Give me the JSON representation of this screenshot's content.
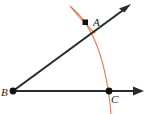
{
  "figure": {
    "background_color": "#ffffff",
    "width": 150,
    "height": 114
  },
  "colors": {
    "ray_stroke": "#2b2b2b",
    "point_fill": "#111111",
    "arc_stroke": "#e08050",
    "label_fill": "#1a1a1a"
  },
  "points": [
    {
      "id": "A",
      "label": "A",
      "marker": "square",
      "x": 85,
      "y": 22,
      "label_x": 93,
      "label_y": 26
    },
    {
      "id": "B",
      "label": "B",
      "marker": "circle",
      "x": 13,
      "y": 91,
      "label_x": 2,
      "label_y": 96
    },
    {
      "id": "C",
      "label": "C",
      "marker": "circle",
      "x": 109,
      "y": 91,
      "label_x": 112,
      "label_y": 103
    }
  ],
  "rays": [
    {
      "id": "ray-BA",
      "name": "ray-b-to-a",
      "from": "B",
      "to": "A",
      "start_x": 13,
      "start_y": 91,
      "end_x": 130,
      "end_y": 5,
      "arrowhead": "end"
    },
    {
      "id": "ray-BC",
      "name": "ray-b-to-c",
      "from": "B",
      "to": "C",
      "start_x": 13,
      "start_y": 91,
      "end_x": 143,
      "end_y": 91,
      "arrowhead": "end"
    }
  ],
  "arcs": [
    {
      "id": "arc-main",
      "name": "compass-arc-through-a-and-c",
      "path": "M 71 7 Q 104 34 111 114",
      "stroke_width": 1.1
    },
    {
      "id": "arc-small",
      "name": "compass-arc-small-at-a",
      "path": "M 70 6 Q 80 19 95 33",
      "stroke_width": 1.1
    }
  ],
  "markers": {
    "arrow_size": 7,
    "point_radius": 3,
    "square_size": 5
  }
}
